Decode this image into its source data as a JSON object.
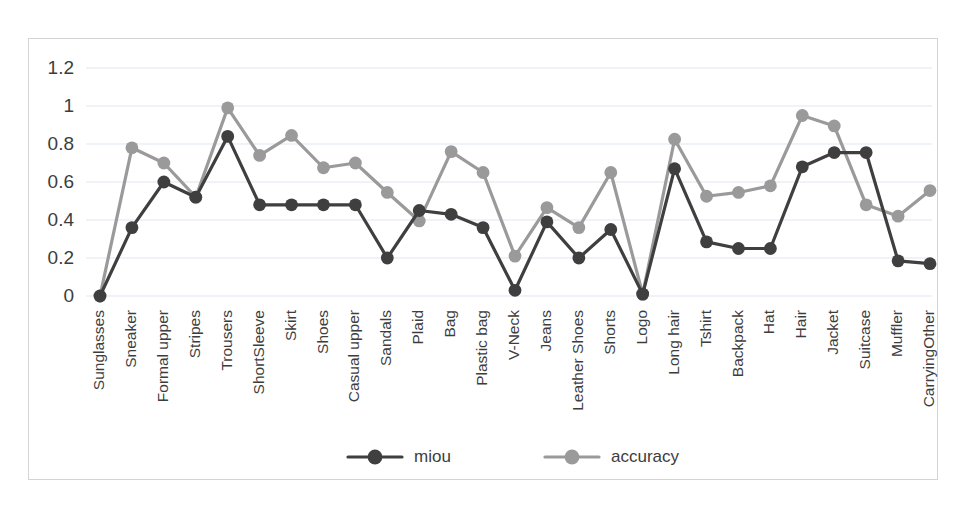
{
  "chart_data": {
    "type": "line",
    "title": "",
    "xlabel": "",
    "ylabel": "",
    "ylim": [
      0,
      1.2
    ],
    "grid": true,
    "legend_position": "bottom",
    "ytick_labels": [
      "1.2",
      "1",
      "0.8",
      "0.6",
      "0.4",
      "0.2",
      "0"
    ],
    "ytick_values": [
      1.2,
      1,
      0.8,
      0.6,
      0.4,
      0.2,
      0
    ],
    "categories": [
      "Sunglasses",
      "Sneaker",
      "Formal upper",
      "Stripes",
      "Trousers",
      "ShortSleeve",
      "Skirt",
      "Shoes",
      "Casual upper",
      "Sandals",
      "Plaid",
      "Bag",
      "Plastic bag",
      "V-Neck",
      "Jeans",
      "Leather Shoes",
      "Shorts",
      "Logo",
      "Long hair",
      "Tshirt",
      "Backpack",
      "Hat",
      "Hair",
      "Jacket",
      "Suitcase",
      "Muffler",
      "CarryingOther"
    ],
    "series": [
      {
        "name": "miou",
        "color": "#3f3f3f",
        "values": [
          0.0,
          0.36,
          0.6,
          0.52,
          0.84,
          0.48,
          0.48,
          0.48,
          0.48,
          0.2,
          0.45,
          0.43,
          0.36,
          0.03,
          0.39,
          0.2,
          0.35,
          0.01,
          0.67,
          0.285,
          0.25,
          0.25,
          0.68,
          0.755,
          0.755,
          0.185,
          0.17
        ]
      },
      {
        "name": "accuracy",
        "color": "#9a9a9a",
        "values": [
          0.0,
          0.78,
          0.7,
          0.52,
          0.99,
          0.74,
          0.845,
          0.675,
          0.7,
          0.545,
          0.395,
          0.76,
          0.65,
          0.21,
          0.465,
          0.36,
          0.65,
          0.01,
          0.825,
          0.525,
          0.545,
          0.58,
          0.95,
          0.895,
          0.48,
          0.42,
          0.555
        ]
      }
    ],
    "legend": [
      {
        "label": "miou",
        "color": "#3f3f3f"
      },
      {
        "label": "accuracy",
        "color": "#9a9a9a"
      }
    ]
  }
}
